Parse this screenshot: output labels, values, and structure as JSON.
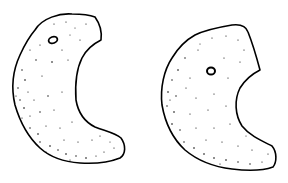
{
  "figure": {
    "stroke_color": "#000000",
    "background_color": "#ffffff",
    "objects": [
      {
        "name": "left-crescent",
        "hole": true
      },
      {
        "name": "right-crescent",
        "hole": true
      }
    ]
  }
}
